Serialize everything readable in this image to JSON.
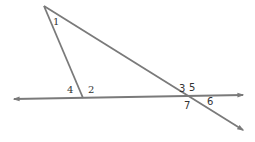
{
  "diagram": {
    "type": "geometry-angles",
    "line_color": "#7a7a7a",
    "label_color": "#333333",
    "points": {
      "apex": [
        44,
        6
      ],
      "left_foot": [
        83,
        98
      ],
      "right_cross": [
        209,
        96
      ]
    },
    "lines": {
      "horizontal": {
        "from": [
          14,
          99
        ],
        "to": [
          243,
          95
        ],
        "arrows": "both"
      },
      "left_segment": {
        "from": [
          44,
          6
        ],
        "to": [
          83,
          98
        ],
        "arrows": "none"
      },
      "transversal": {
        "from": [
          44,
          6
        ],
        "to": [
          243,
          130
        ],
        "arrows": "end"
      }
    },
    "labels": [
      {
        "id": "1",
        "text": "1",
        "x": 53,
        "y": 25
      },
      {
        "id": "4",
        "text": "4",
        "x": 67,
        "y": 93
      },
      {
        "id": "2",
        "text": "2",
        "x": 88,
        "y": 93
      },
      {
        "id": "3",
        "text": "3",
        "x": 179,
        "y": 92
      },
      {
        "id": "5",
        "text": "5",
        "x": 189,
        "y": 91
      },
      {
        "id": "7",
        "text": "7",
        "x": 184,
        "y": 109
      },
      {
        "id": "6",
        "text": "6",
        "x": 207,
        "y": 105
      }
    ]
  }
}
